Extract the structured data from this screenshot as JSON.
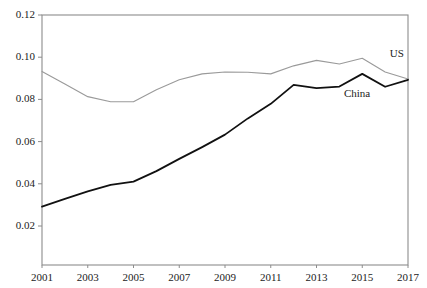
{
  "chart_data": {
    "type": "line",
    "title": "",
    "subtitle": "",
    "xlabel": "",
    "ylabel": "",
    "xlim": [
      2001,
      2017
    ],
    "ylim": [
      0.0,
      0.12
    ],
    "grid": false,
    "legend_position": "inline-right-of-line-ends",
    "x": [
      2001,
      2002,
      2003,
      2004,
      2005,
      2006,
      2007,
      2008,
      2009,
      2010,
      2011,
      2012,
      2013,
      2014,
      2015,
      2016,
      2017
    ],
    "xtick_labels": [
      "2001",
      "2003",
      "2005",
      "2007",
      "2009",
      "2011",
      "2013",
      "2015",
      "2017"
    ],
    "xtick_values": [
      2001,
      2003,
      2005,
      2007,
      2009,
      2011,
      2013,
      2015,
      2017
    ],
    "ytick_labels": [
      "0.02",
      "0.04",
      "0.06",
      "0.08",
      "0.10",
      "0.12"
    ],
    "ytick_values": [
      0.02,
      0.04,
      0.06,
      0.08,
      0.1,
      0.12
    ],
    "series": [
      {
        "name": "US",
        "label": "US",
        "color": "#9a9a9a",
        "line_width": 1.1,
        "values": [
          0.0932,
          0.0873,
          0.0813,
          0.0789,
          0.0789,
          0.0846,
          0.0893,
          0.0921,
          0.093,
          0.0929,
          0.0921,
          0.0959,
          0.0985,
          0.0968,
          0.0995,
          0.093,
          0.0897
        ]
      },
      {
        "name": "China",
        "label": "China",
        "color": "#111111",
        "line_width": 1.8,
        "values": [
          0.0292,
          0.0329,
          0.0364,
          0.0395,
          0.041,
          0.046,
          0.0518,
          0.0574,
          0.0633,
          0.071,
          0.0779,
          0.0869,
          0.0853,
          0.0861,
          0.0921,
          0.086,
          0.0893
        ]
      }
    ],
    "annotations": [
      {
        "text": "US",
        "series": "US",
        "x": 2016.2,
        "y": 0.1015
      },
      {
        "text": "China",
        "series": "China",
        "x": 2014.2,
        "y": 0.0825
      }
    ]
  },
  "axes": {
    "frame_color": "#8c8c8c",
    "background": "#ffffff"
  }
}
